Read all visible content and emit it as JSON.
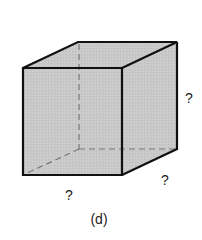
{
  "figure": {
    "caption": "(d)",
    "shape": "cube",
    "labels": {
      "width": "?",
      "depth": "?",
      "height": "?"
    },
    "colors": {
      "face_fill": "#c8c8c8",
      "edge": "#111111",
      "hidden_edge": "#777777",
      "text": "#222222"
    }
  }
}
